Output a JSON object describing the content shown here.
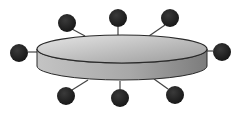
{
  "diagram": {
    "type": "bus-topology",
    "colors": {
      "background": "#ffffff",
      "node_fill": "#1e1e1e",
      "line": "#444444",
      "disc_top_light": "#e6e6e6",
      "disc_top_dark": "#9a9a9a",
      "disc_side_light": "#c4c4c4",
      "disc_side_dark": "#7c7c7c",
      "outline": "#2a2a2a"
    },
    "hub": {
      "cx": 122,
      "top_cy": 49,
      "bottom_cy": 66,
      "rx": 85,
      "ry": 14
    },
    "nodes": [
      {
        "id": "node-top-left",
        "cx": 67,
        "cy": 23,
        "r": 9,
        "lx1": 72,
        "ly1": 29,
        "lx2": 85,
        "ly2": 36
      },
      {
        "id": "node-top-center",
        "cx": 118,
        "cy": 18,
        "r": 9,
        "lx1": 118,
        "ly1": 27,
        "lx2": 118,
        "ly2": 35
      },
      {
        "id": "node-top-right",
        "cx": 170,
        "cy": 18,
        "r": 9,
        "lx1": 165,
        "ly1": 25,
        "lx2": 149,
        "ly2": 36
      },
      {
        "id": "node-left",
        "cx": 19,
        "cy": 53,
        "r": 9,
        "lx1": 28,
        "ly1": 52,
        "lx2": 37,
        "ly2": 52
      },
      {
        "id": "node-right",
        "cx": 222,
        "cy": 52,
        "r": 9,
        "lx1": 207,
        "ly1": 51,
        "lx2": 213,
        "ly2": 51
      },
      {
        "id": "node-bottom-left",
        "cx": 66,
        "cy": 96,
        "r": 9,
        "lx1": 72,
        "ly1": 90,
        "lx2": 88,
        "ly2": 80
      },
      {
        "id": "node-bottom-center",
        "cx": 120,
        "cy": 98,
        "r": 9,
        "lx1": 120,
        "ly1": 81,
        "lx2": 120,
        "ly2": 89
      },
      {
        "id": "node-bottom-right",
        "cx": 175,
        "cy": 95,
        "r": 9,
        "lx1": 168,
        "ly1": 89,
        "lx2": 154,
        "ly2": 79
      }
    ]
  }
}
